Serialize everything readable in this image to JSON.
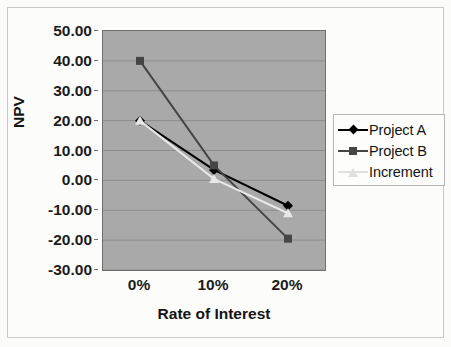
{
  "chart_data": {
    "type": "line",
    "title": "",
    "xlabel": "Rate of Interest",
    "ylabel": "NPV",
    "categories": [
      "0%",
      "10%",
      "20%"
    ],
    "x": [
      0,
      10,
      20
    ],
    "ylim": [
      -30,
      50
    ],
    "yticks": [
      50,
      40,
      30,
      20,
      10,
      0,
      -10,
      -20,
      -30
    ],
    "ytick_labels": [
      "50.00",
      "40.00",
      "30.00",
      "20.00",
      "10.00",
      "0.00",
      "-10.00",
      "-20.00",
      "-30.00"
    ],
    "grid": "horizontal",
    "legend_position": "right",
    "plot_background": "#a9a9a9",
    "series": [
      {
        "name": "Project A",
        "values": [
          20.0,
          3.5,
          -8.5
        ],
        "color": "#000000",
        "marker": "diamond"
      },
      {
        "name": "Project B",
        "values": [
          40.0,
          5.0,
          -19.5
        ],
        "color": "#454545",
        "marker": "square"
      },
      {
        "name": "Increment",
        "values": [
          20.0,
          0.5,
          -11.0
        ],
        "color": "#e8e8e8",
        "marker": "triangle"
      }
    ]
  },
  "axes": {
    "y_title": "NPV",
    "x_title": "Rate of Interest",
    "y_ticks": [
      "50.00",
      "40.00",
      "30.00",
      "20.00",
      "10.00",
      "0.00",
      "-10.00",
      "-20.00",
      "-30.00"
    ],
    "x_ticks": [
      "0%",
      "10%",
      "20%"
    ]
  },
  "legend": {
    "items": [
      {
        "label": "Project A",
        "color": "#000000",
        "marker": "diamond-icon"
      },
      {
        "label": "Project B",
        "color": "#454545",
        "marker": "square-icon"
      },
      {
        "label": "Increment",
        "color": "#e0e0e0",
        "marker": "triangle-icon"
      }
    ]
  }
}
